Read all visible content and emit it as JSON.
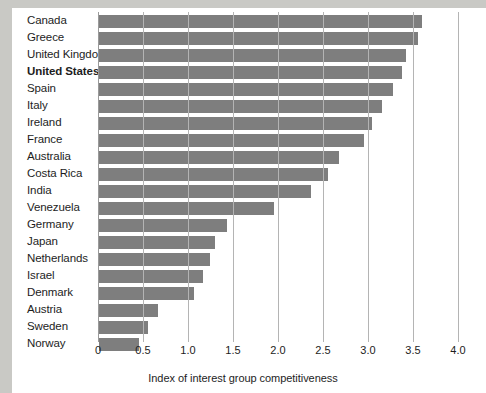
{
  "chart_data": {
    "type": "bar",
    "orientation": "horizontal",
    "title": "",
    "xlabel": "Index of interest group competitiveness",
    "ylabel": "",
    "xlim": [
      0,
      4.0
    ],
    "xticks": [
      "0",
      "0.5",
      "1.0",
      "1.5",
      "2.0",
      "2.5",
      "3.0",
      "3.5",
      "4.0"
    ],
    "xtick_values": [
      0,
      0.5,
      1.0,
      1.5,
      2.0,
      2.5,
      3.0,
      3.5,
      4.0
    ],
    "grid": "vertical",
    "legend": "none",
    "bar_color": "#7e7e7e",
    "highlight_category": "United States",
    "categories": [
      "Canada",
      "Greece",
      "United Kingdom",
      "United States",
      "Spain",
      "Italy",
      "Ireland",
      "France",
      "Australia",
      "Costa Rica",
      "India",
      "Venezuela",
      "Germany",
      "Japan",
      "Netherlands",
      "Israel",
      "Denmark",
      "Austria",
      "Sweden",
      "Norway"
    ],
    "values": [
      3.6,
      3.55,
      3.42,
      3.38,
      3.28,
      3.16,
      3.04,
      2.96,
      2.68,
      2.55,
      2.37,
      1.96,
      1.43,
      1.3,
      1.24,
      1.17,
      1.07,
      0.67,
      0.56,
      0.46
    ]
  }
}
